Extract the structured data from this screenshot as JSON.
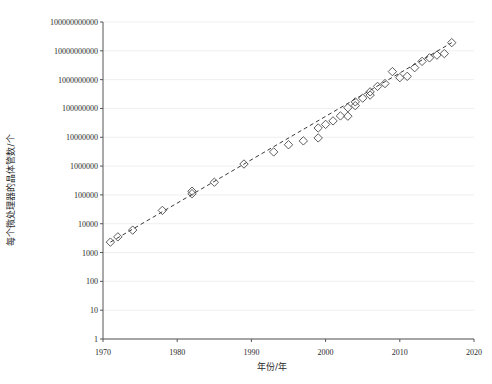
{
  "chart_data": {
    "type": "scatter",
    "title": "",
    "xlabel": "年份/年",
    "ylabel": "每个微处理器的晶体管数/个",
    "xlim": [
      1970,
      2020
    ],
    "ylim": [
      1,
      100000000000
    ],
    "yscale": "log",
    "xscale": "linear",
    "grid": true,
    "grid_axis": "y",
    "legend": "none",
    "marker_style": "open-diamond",
    "trend_line": {
      "style": "dashed",
      "x": [
        1971,
        2017
      ],
      "y": [
        2300,
        19200000000
      ]
    },
    "xticks": [
      1970,
      1980,
      1990,
      2000,
      2010,
      2020
    ],
    "xtick_labels": [
      "1970",
      "1980",
      "1990",
      "2000",
      "2010",
      "2020"
    ],
    "yticks": [
      1,
      10,
      100,
      1000,
      10000,
      100000,
      1000000,
      10000000,
      100000000,
      1000000000,
      10000000000,
      100000000000
    ],
    "ytick_labels": [
      "1",
      "10",
      "100",
      "1000",
      "10000",
      "100000",
      "1000000",
      "10000000",
      "100000000",
      "1000000000",
      "10000000000",
      "100000000000"
    ],
    "points": [
      {
        "x": 1971,
        "y": 2300
      },
      {
        "x": 1972,
        "y": 3500
      },
      {
        "x": 1974,
        "y": 6000
      },
      {
        "x": 1978,
        "y": 29000
      },
      {
        "x": 1982,
        "y": 134000
      },
      {
        "x": 1982,
        "y": 110000
      },
      {
        "x": 1985,
        "y": 275000
      },
      {
        "x": 1989,
        "y": 1180000
      },
      {
        "x": 1993,
        "y": 3100000
      },
      {
        "x": 1995,
        "y": 5500000
      },
      {
        "x": 1997,
        "y": 7500000
      },
      {
        "x": 1999,
        "y": 9500000
      },
      {
        "x": 1999,
        "y": 21000000
      },
      {
        "x": 2000,
        "y": 28000000
      },
      {
        "x": 2001,
        "y": 37000000
      },
      {
        "x": 2002,
        "y": 55000000
      },
      {
        "x": 2003,
        "y": 54000000
      },
      {
        "x": 2003,
        "y": 106000000
      },
      {
        "x": 2004,
        "y": 125000000
      },
      {
        "x": 2004,
        "y": 169000000
      },
      {
        "x": 2005,
        "y": 228000000
      },
      {
        "x": 2006,
        "y": 291000000
      },
      {
        "x": 2006,
        "y": 376000000
      },
      {
        "x": 2007,
        "y": 582000000
      },
      {
        "x": 2008,
        "y": 731000000
      },
      {
        "x": 2009,
        "y": 1900000000
      },
      {
        "x": 2010,
        "y": 1170000000
      },
      {
        "x": 2011,
        "y": 1300000000
      },
      {
        "x": 2012,
        "y": 2600000000
      },
      {
        "x": 2013,
        "y": 4300000000
      },
      {
        "x": 2014,
        "y": 5700000000
      },
      {
        "x": 2015,
        "y": 7100000000
      },
      {
        "x": 2016,
        "y": 8000000000
      },
      {
        "x": 2017,
        "y": 19200000000
      }
    ]
  }
}
